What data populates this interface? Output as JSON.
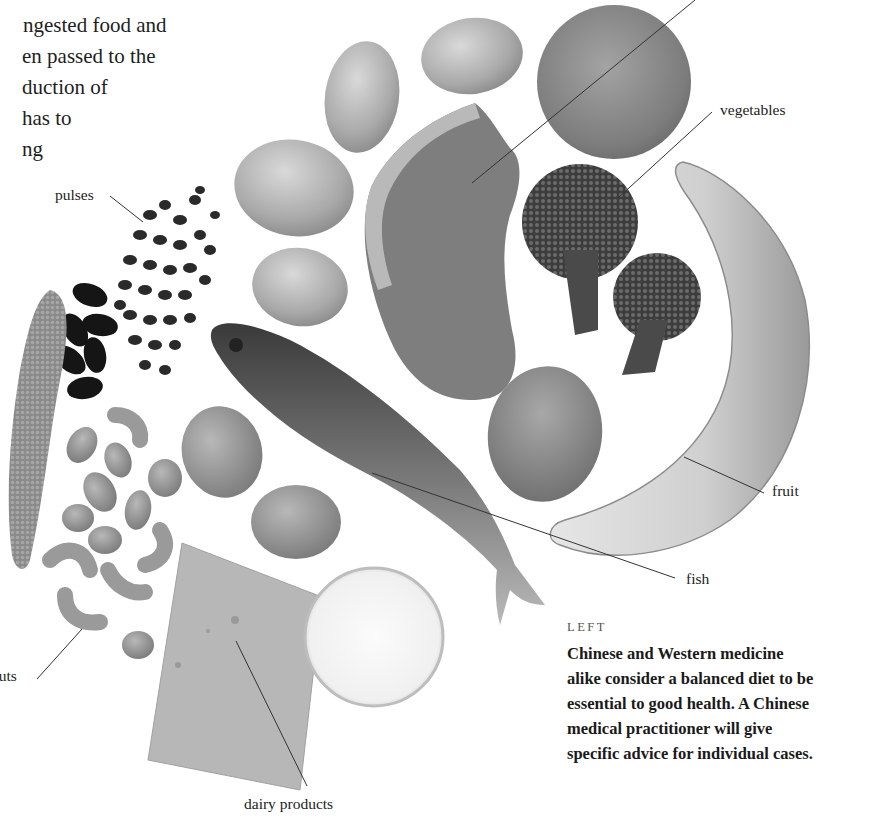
{
  "body_text": {
    "lines": [
      "ngested food and",
      "en passed to the",
      "duction of",
      "has  to",
      "ng"
    ]
  },
  "photo": {
    "description": "Black-and-white photograph of assorted foods arranged in an arc",
    "items": [
      "potatoes",
      "meat",
      "orange",
      "broccoli",
      "banana",
      "egg",
      "pulses",
      "lentils",
      "kidney beans",
      "nuts",
      "walnuts",
      "fish",
      "cheese",
      "glass of milk"
    ]
  },
  "labels": {
    "top_cut": "meat",
    "vegetables": "vegetables",
    "pulses": "pulses",
    "fruit": "fruit",
    "fish": "fish",
    "nuts": "nuts",
    "dairy": "dairy products"
  },
  "caption": {
    "kicker": "LEFT",
    "lines": [
      "Chinese and Western medicine",
      "alike consider a balanced diet to be",
      "essential to good health. A Chinese",
      "medical practitioner will give",
      "specific advice for individual cases."
    ]
  },
  "colors": {
    "background": "#ffffff",
    "text": "#1e1e1e",
    "leader_line": "#333333"
  }
}
